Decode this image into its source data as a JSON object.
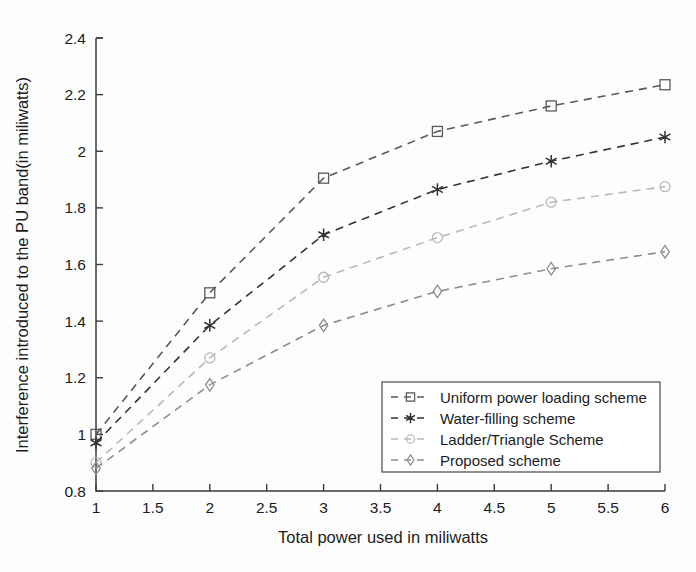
{
  "chart_data": {
    "type": "line",
    "title": "",
    "xlabel": "Total power used in miliwatts",
    "ylabel": "Interference introduced to the PU band(in miliwatts)",
    "x": [
      1,
      2,
      3,
      4,
      5,
      6
    ],
    "xlim": [
      1,
      6
    ],
    "ylim": [
      0.8,
      2.4
    ],
    "xticks": [
      "1",
      "1.5",
      "2",
      "2.5",
      "3",
      "3.5",
      "4",
      "4.5",
      "5",
      "5.5",
      "6"
    ],
    "xtick_values": [
      1,
      1.5,
      2,
      2.5,
      3,
      3.5,
      4,
      4.5,
      5,
      5.5,
      6
    ],
    "yticks": [
      "0.8",
      "1",
      "1.2",
      "1.4",
      "1.6",
      "1.8",
      "2",
      "2.2",
      "2.4"
    ],
    "ytick_values": [
      0.8,
      1.0,
      1.2,
      1.4,
      1.6,
      1.8,
      2.0,
      2.2,
      2.4
    ],
    "grid": false,
    "legend_position": "lower right",
    "linestyle": "dashed",
    "series": [
      {
        "name": "Uniform power loading scheme",
        "marker": "square",
        "color": "#5a5a5a",
        "values": [
          1.0,
          1.5,
          1.905,
          2.07,
          2.16,
          2.235
        ]
      },
      {
        "name": "Water-filling scheme",
        "marker": "asterisk",
        "color": "#333333",
        "values": [
          0.97,
          1.385,
          1.705,
          1.865,
          1.965,
          2.05
        ]
      },
      {
        "name": "Ladder/Triangle Scheme",
        "marker": "circle",
        "color": "#b9b9b9",
        "values": [
          0.9,
          1.27,
          1.555,
          1.695,
          1.82,
          1.875
        ]
      },
      {
        "name": "Proposed scheme",
        "marker": "diamond",
        "color": "#8e8e8e",
        "values": [
          0.88,
          1.175,
          1.385,
          1.505,
          1.585,
          1.645
        ]
      }
    ]
  },
  "legend": {
    "entries": [
      "Uniform power loading scheme",
      "Water-filling scheme",
      "Ladder/Triangle Scheme",
      "Proposed scheme"
    ]
  }
}
